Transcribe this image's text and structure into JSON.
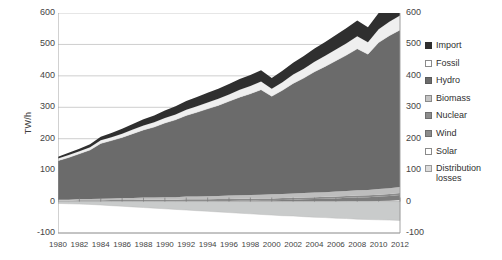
{
  "chart_data": {
    "type": "area",
    "title": "",
    "subtitle": "",
    "xlabel": "",
    "ylabel": "TW/h",
    "stacked": true,
    "grid": true,
    "legend_position": "right",
    "xlim": [
      1980,
      2012
    ],
    "ylim": [
      -100,
      600
    ],
    "ytick_step": 100,
    "yticks": [
      600,
      500,
      400,
      300,
      200,
      100,
      0,
      -100
    ],
    "yticks_right": [
      600,
      500,
      400,
      300,
      200,
      100,
      0,
      -100
    ],
    "categories": [
      1980,
      1981,
      1982,
      1983,
      1984,
      1985,
      1986,
      1987,
      1988,
      1989,
      1990,
      1991,
      1992,
      1993,
      1994,
      1995,
      1996,
      1997,
      1998,
      1999,
      2000,
      2001,
      2002,
      2003,
      2004,
      2005,
      2006,
      2007,
      2008,
      2009,
      2010,
      2011,
      2012
    ],
    "xtick_labels": [
      "1980",
      "1982",
      "1984",
      "1986",
      "1988",
      "1990",
      "1992",
      "1994",
      "1996",
      "1998",
      "2000",
      "2002",
      "2004",
      "2006",
      "2008",
      "2010",
      "2012"
    ],
    "series": [
      {
        "name": "Distribution losses",
        "color": "#c9cbcb",
        "swatch": "light",
        "values": [
          -6,
          -7,
          -8,
          -9,
          -11,
          -13,
          -15,
          -17,
          -19,
          -21,
          -23,
          -25,
          -27,
          -29,
          -31,
          -33,
          -35,
          -37,
          -39,
          -41,
          -43,
          -45,
          -46,
          -48,
          -50,
          -51,
          -53,
          -54,
          -56,
          -57,
          -58,
          -59,
          -60
        ]
      },
      {
        "name": "Solar",
        "color": "#e8e8e8",
        "swatch": "light",
        "values": [
          0,
          0,
          0,
          0,
          0,
          0,
          0,
          0,
          0,
          0,
          0,
          0,
          0,
          0,
          0,
          0,
          0,
          0,
          0,
          0,
          0,
          0,
          0,
          0,
          0,
          0,
          0,
          1,
          1,
          1,
          2,
          3,
          5
        ]
      },
      {
        "name": "Wind",
        "color": "#7d7d7d",
        "swatch": "mid",
        "values": [
          0,
          0,
          0,
          0,
          0,
          0,
          0,
          0,
          0,
          0,
          0,
          0,
          1,
          1,
          1,
          2,
          2,
          3,
          3,
          4,
          4,
          5,
          6,
          7,
          8,
          9,
          10,
          11,
          12,
          13,
          14,
          15,
          16
        ]
      },
      {
        "name": "Nuclear",
        "color": "#8c8c8c",
        "swatch": "mid",
        "values": [
          3,
          3,
          4,
          4,
          4,
          5,
          5,
          5,
          6,
          6,
          6,
          6,
          6,
          6,
          6,
          6,
          6,
          6,
          6,
          6,
          6,
          6,
          6,
          6,
          6,
          6,
          6,
          6,
          6,
          6,
          6,
          6,
          6
        ]
      },
      {
        "name": "Biomass",
        "color": "#bdbdbd",
        "swatch": "lightmid",
        "values": [
          3,
          3,
          4,
          4,
          5,
          5,
          6,
          6,
          7,
          7,
          8,
          8,
          9,
          9,
          10,
          10,
          11,
          11,
          12,
          12,
          13,
          13,
          14,
          14,
          15,
          15,
          16,
          16,
          17,
          17,
          18,
          18,
          19
        ]
      },
      {
        "name": "Hydro",
        "color": "#6b6b6b",
        "swatch": "dark",
        "values": [
          124,
          134,
          144,
          156,
          176,
          184,
          193,
          205,
          215,
          224,
          236,
          246,
          258,
          268,
          278,
          288,
          300,
          312,
          322,
          334,
          312,
          330,
          350,
          366,
          384,
          400,
          416,
          432,
          450,
          432,
          466,
          486,
          500
        ]
      },
      {
        "name": "Fossil",
        "color": "#efefef",
        "swatch": "white",
        "values": [
          7,
          8,
          8,
          9,
          10,
          11,
          12,
          13,
          14,
          15,
          16,
          17,
          18,
          19,
          20,
          21,
          22,
          24,
          25,
          26,
          24,
          26,
          28,
          30,
          32,
          34,
          36,
          38,
          40,
          38,
          42,
          44,
          46
        ]
      },
      {
        "name": "Import",
        "color": "#2f2f2f",
        "swatch": "black",
        "values": [
          6,
          7,
          8,
          9,
          11,
          13,
          16,
          18,
          20,
          22,
          24,
          26,
          28,
          30,
          31,
          32,
          33,
          34,
          35,
          36,
          34,
          36,
          38,
          40,
          42,
          44,
          46,
          48,
          50,
          48,
          52,
          54,
          24
        ]
      }
    ],
    "stack_order_bottom_to_top": [
      "Solar",
      "Wind",
      "Nuclear",
      "Biomass",
      "Hydro",
      "Fossil",
      "Import"
    ],
    "negative_series": [
      "Distribution losses"
    ]
  },
  "legend": {
    "items": [
      {
        "label": "Import",
        "swatch": "black"
      },
      {
        "label": "Fossil",
        "swatch": "white"
      },
      {
        "label": "Hydro",
        "swatch": "dark"
      },
      {
        "label": "Biomass",
        "swatch": "lightmid"
      },
      {
        "label": "Nuclear",
        "swatch": "mid"
      },
      {
        "label": "Wind",
        "swatch": "mid"
      },
      {
        "label": "Solar",
        "swatch": "white"
      },
      {
        "label": "Distribution losses",
        "swatch": "light"
      }
    ]
  },
  "colors": {
    "import": "#2f2f2f",
    "fossil": "#efefef",
    "hydro": "#6b6b6b",
    "biomass": "#bdbdbd",
    "nuclear": "#8c8c8c",
    "wind": "#7d7d7d",
    "solar": "#e8e8e8",
    "distribution_losses": "#c9cbcb",
    "grid": "#b8b8b8",
    "axis": "#9a9a9a",
    "text": "#444444"
  }
}
